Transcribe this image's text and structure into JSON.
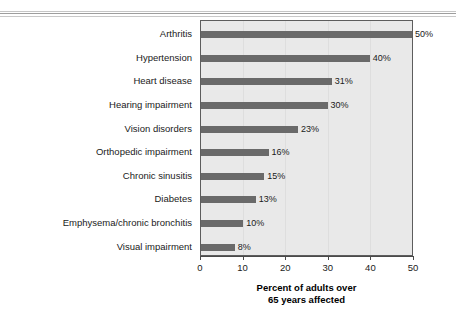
{
  "chart_data": {
    "type": "bar",
    "orientation": "horizontal",
    "title": "",
    "subtitle": "",
    "xlabel": "Percent of adults over 65 years affected",
    "xlabel_line1": "Percent of adults over",
    "xlabel_line2": "65 years affected",
    "ylabel": "",
    "categories": [
      "Arthritis",
      "Hypertension",
      "Heart disease",
      "Hearing impairment",
      "Vision disorders",
      "Orthopedic impairment",
      "Chronic sinusitis",
      "Diabetes",
      "Emphysema/chronic bronchitis",
      "Visual impairment"
    ],
    "values": [
      50,
      40,
      31,
      30,
      23,
      16,
      15,
      13,
      10,
      8
    ],
    "value_labels": [
      "50%",
      "40%",
      "31%",
      "30%",
      "23%",
      "16%",
      "15%",
      "13%",
      "10%",
      "8%"
    ],
    "xlim": [
      0,
      50
    ],
    "xticks": [
      0,
      10,
      20,
      30,
      40,
      50
    ],
    "xtick_labels": [
      "0",
      "10",
      "20",
      "30",
      "40",
      "50"
    ],
    "grid": true,
    "legend": false,
    "colors": {
      "bar": "#6a6a6a",
      "plot_background": "#e9e9e9",
      "plot_border": "#5d5d5d",
      "gridline": "#dedede",
      "axis": "#4a4a4a",
      "text": "#1a1a1a",
      "page_background": "#ffffff"
    }
  }
}
